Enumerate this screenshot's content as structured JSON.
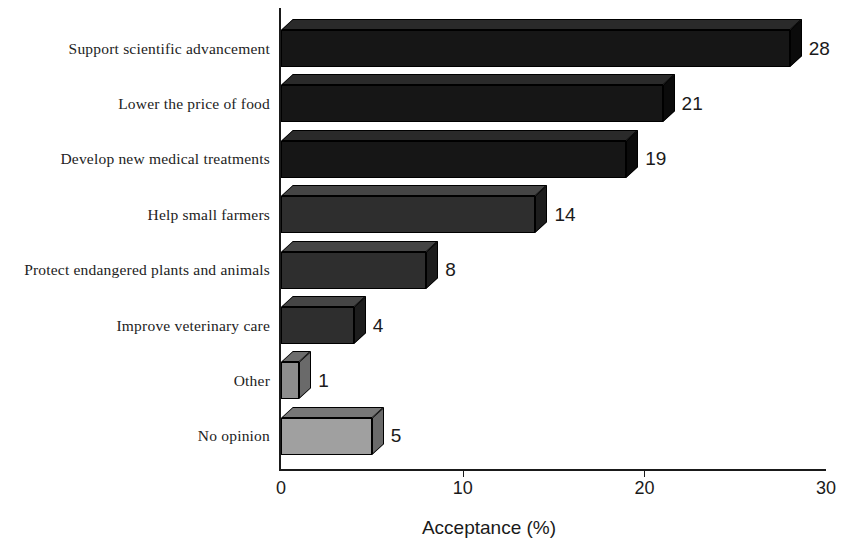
{
  "chart_data": {
    "type": "bar",
    "orientation": "horizontal",
    "title": "",
    "subtitle": "",
    "xlabel": "Acceptance (%)",
    "ylabel": "",
    "xlim": [
      0,
      30
    ],
    "xticks": [
      0,
      10,
      20,
      30
    ],
    "xtick_labels": [
      "0",
      "10",
      "20",
      "30"
    ],
    "grid": false,
    "legend": "none",
    "style": "3d-bars",
    "categories": [
      "Support scientific advancement",
      "Lower the price of food",
      "Develop new medical treatments",
      "Help small farmers",
      "Protect endangered plants and animals",
      "Improve veterinary care",
      "Other",
      "No opinion"
    ],
    "values": [
      28,
      21,
      19,
      14,
      8,
      4,
      1,
      5
    ],
    "value_labels": [
      "28",
      "21",
      "19",
      "14",
      "8",
      "4",
      "1",
      "5"
    ],
    "bar_colors": [
      "#161616",
      "#161616",
      "#161616",
      "#2e2e2e",
      "#2e2e2e",
      "#2e2e2e",
      "#8d8d8d",
      "#a0a0a0"
    ],
    "bar_top_colors": [
      "#2a2a2a",
      "#2a2a2a",
      "#2a2a2a",
      "#454545",
      "#454545",
      "#454545",
      "#6d6d6d",
      "#777777"
    ],
    "bar_side_colors": [
      "#0b0b0b",
      "#0b0b0b",
      "#0b0b0b",
      "#1d1d1d",
      "#1d1d1d",
      "#1d1d1d",
      "#6a6a6a",
      "#6a6a6a"
    ]
  },
  "axis": {
    "title": "Acceptance (%)"
  },
  "colors": {
    "axis": "#1a1a1a",
    "text": "#1a1a1a",
    "label_text": "#222222",
    "background": "#ffffff"
  }
}
